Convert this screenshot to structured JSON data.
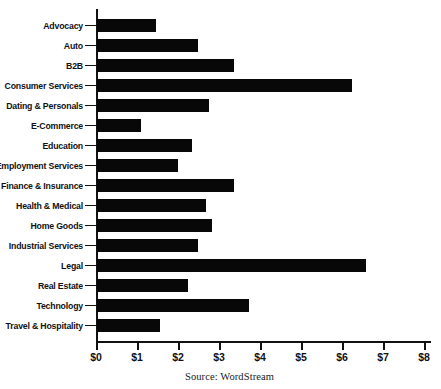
{
  "chart_data": {
    "type": "bar",
    "orientation": "horizontal",
    "title": "",
    "xlabel": "",
    "ylabel": "",
    "xlim": [
      0,
      8
    ],
    "grid": false,
    "legend": null,
    "source": "Source: WordStream",
    "x_tick_labels": [
      "$0",
      "$1",
      "$2",
      "$3",
      "$4",
      "$5",
      "$6",
      "$7",
      "$8"
    ],
    "x_tick_values": [
      0,
      1,
      2,
      3,
      4,
      5,
      6,
      7,
      8
    ],
    "categories": [
      "Advocacy",
      "Auto",
      "B2B",
      "Consumer Services",
      "Dating & Personals",
      "E-Commerce",
      "Education",
      "Employment Services",
      "Finance & Insurance",
      "Health & Medical",
      "Home Goods",
      "Industrial Services",
      "Legal",
      "Real Estate",
      "Technology",
      "Travel & Hospitality"
    ],
    "values": [
      1.43,
      2.46,
      3.33,
      6.22,
      2.73,
      1.07,
      2.32,
      1.98,
      3.33,
      2.65,
      2.8,
      2.46,
      6.56,
      2.22,
      3.7,
      1.53
    ],
    "bar_color": "#080808"
  }
}
